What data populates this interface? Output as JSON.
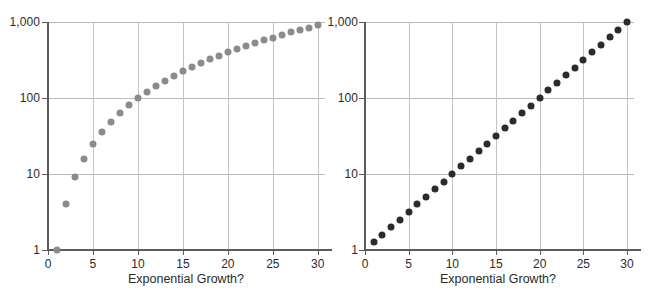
{
  "chart_data": [
    {
      "panel": "left",
      "type": "scatter",
      "title": "",
      "xlabel": "Exponential Growth?",
      "ylabel": "",
      "yscale": "log",
      "xlim": [
        0,
        30.8
      ],
      "ylim": [
        1,
        2000
      ],
      "grid": true,
      "legend": null,
      "marker_color": "#8b8b8b",
      "xticks": [
        0,
        5,
        10,
        15,
        20,
        25,
        30
      ],
      "xticklabels": [
        "0",
        "5",
        "10",
        "15",
        "20",
        "25",
        "30"
      ],
      "yticks": [
        1,
        10,
        100,
        1000
      ],
      "yticklabels": [
        "1",
        "10",
        "100",
        "1,000"
      ],
      "x": [
        1,
        2,
        3,
        4,
        5,
        6,
        7,
        8,
        9,
        10,
        11,
        12,
        13,
        14,
        15,
        16,
        17,
        18,
        19,
        20,
        21,
        22,
        23,
        24,
        25,
        26,
        27,
        28,
        29,
        30
      ],
      "values": [
        1,
        4,
        9,
        16,
        25,
        36,
        49,
        64,
        81,
        100,
        121,
        144,
        169,
        196,
        225,
        256,
        289,
        324,
        361,
        400,
        441,
        484,
        529,
        576,
        625,
        676,
        729,
        784,
        841,
        900
      ],
      "relation": "y = x^2"
    },
    {
      "panel": "right",
      "type": "scatter",
      "title": "",
      "xlabel": "Exponential Growth?",
      "ylabel": "",
      "yscale": "log",
      "xlim": [
        0,
        30.8
      ],
      "ylim": [
        1,
        2000
      ],
      "grid": true,
      "legend": null,
      "marker_color": "#2b2b2b",
      "xticks": [
        0,
        5,
        10,
        15,
        20,
        25,
        30
      ],
      "xticklabels": [
        "0",
        "5",
        "10",
        "15",
        "20",
        "25",
        "30"
      ],
      "yticks": [
        1,
        10,
        100,
        1000
      ],
      "yticklabels": [
        "1",
        "10",
        "100",
        "1,000"
      ],
      "x": [
        1,
        2,
        3,
        4,
        5,
        6,
        7,
        8,
        9,
        10,
        11,
        12,
        13,
        14,
        15,
        16,
        17,
        18,
        19,
        20,
        21,
        22,
        23,
        24,
        25,
        26,
        27,
        28,
        29,
        30
      ],
      "values": [
        1.26,
        1.58,
        2.0,
        2.51,
        3.16,
        3.98,
        5.01,
        6.31,
        7.94,
        10.0,
        12.6,
        15.8,
        20.0,
        25.1,
        31.6,
        39.8,
        50.1,
        63.1,
        79.4,
        100.0,
        126,
        158,
        200,
        251,
        316,
        398,
        501,
        631,
        794,
        1000
      ],
      "relation": "y = 10^(x/10)"
    }
  ],
  "panels": {
    "left": {
      "axis_title": "Exponential Growth?",
      "y_labels": [
        "1,000",
        "100",
        "10",
        "1"
      ],
      "x_labels": [
        "0",
        "5",
        "10",
        "15",
        "20",
        "25",
        "30"
      ]
    },
    "right": {
      "axis_title": "Exponential Growth?",
      "y_labels": [
        "1,000",
        "100",
        "10",
        "1"
      ],
      "x_labels": [
        "0",
        "5",
        "10",
        "15",
        "20",
        "25",
        "30"
      ]
    }
  },
  "colors": {
    "left_marker": "#8b8b8b",
    "right_marker": "#2b2b2b",
    "axis": "#5b5b5b",
    "grid": "#b9b9b9",
    "text": "#2b2b2b",
    "background": "#ffffff"
  }
}
